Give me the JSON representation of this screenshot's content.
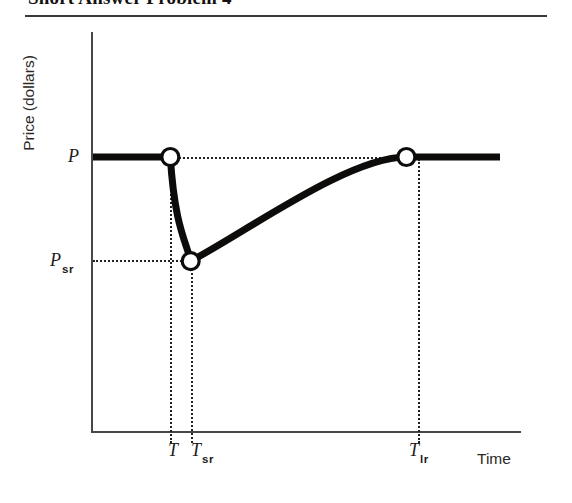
{
  "header": {
    "title": "Short Answer Problem 4"
  },
  "chart_data": {
    "type": "line",
    "title": "",
    "xlabel": "Time",
    "ylabel": "Price (dollars)",
    "xlim": [
      0,
      100
    ],
    "ylim": [
      0,
      100
    ],
    "grid": false,
    "legend": null,
    "x_tick_labels": [
      "T",
      "T",
      "T"
    ],
    "x_tick_subscripts": [
      "",
      "sr",
      "lr"
    ],
    "x_ticks_display": [
      "T",
      "Tsr",
      "Tlr"
    ],
    "y_tick_labels": [
      "P",
      "P"
    ],
    "y_tick_subscripts": [
      "",
      "sr"
    ],
    "y_ticks_display": [
      "P",
      "Psr"
    ],
    "annotations": [
      "Price holds at P until time T",
      "Price drops sharply to Psr at time Tsr",
      "Price recovers gradually back to P by time Tlr",
      "Price remains at P after Tlr"
    ],
    "series": [
      {
        "name": "Price path",
        "description": "Initial level, short-run overshoot downward, gradual long-run return",
        "points": [
          {
            "label": "start",
            "x": 0,
            "y": 100
          },
          {
            "label": "T",
            "x": 19,
            "y": 100
          },
          {
            "label": "Tsr",
            "x": 24,
            "y": 62
          },
          {
            "label": "Tlr",
            "x": 77,
            "y": 100
          },
          {
            "label": "end",
            "x": 100,
            "y": 100
          }
        ]
      }
    ],
    "markers": [
      {
        "name": "marker-T",
        "x": 19,
        "y": 100
      },
      {
        "name": "marker-Tsr",
        "x": 24,
        "y": 62
      },
      {
        "name": "marker-Tlr",
        "x": 77,
        "y": 100
      }
    ],
    "guide_lines": [
      {
        "name": "guide-P",
        "orientation": "horizontal",
        "value": "P"
      },
      {
        "name": "guide-Psr",
        "orientation": "horizontal",
        "value": "Psr"
      },
      {
        "name": "guide-T",
        "orientation": "vertical",
        "value": "T"
      },
      {
        "name": "guide-Tsr",
        "orientation": "vertical",
        "value": "Tsr"
      },
      {
        "name": "guide-Tlr",
        "orientation": "vertical",
        "value": "Tlr"
      }
    ],
    "colors": {
      "curve": "#0d0c0b",
      "axis": "#4a4644",
      "guide": "#23201e",
      "marker_fill": "#ffffff",
      "background": "#ffffff"
    }
  }
}
